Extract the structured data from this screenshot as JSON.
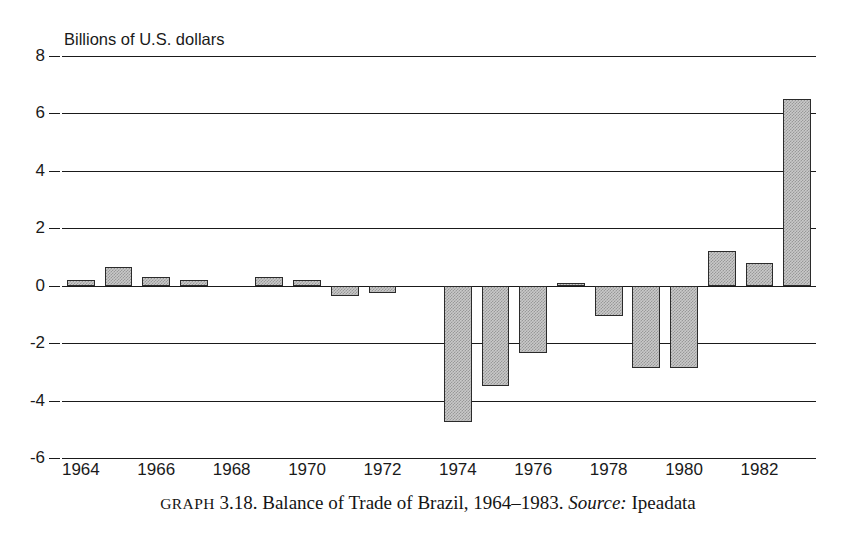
{
  "axis_title": "Billions of U.S. dollars",
  "caption": {
    "label": "GRAPH",
    "number": "3.18.",
    "text": "Balance of Trade of Brazil, 1964–1983.",
    "source_label": "Source:",
    "source_value": "Ipeadata"
  },
  "style": {
    "bar_fill": "#c9c9c9",
    "bar_border": "#2b2b2b",
    "gridline": "#1a1a1a",
    "background": "#ffffff"
  },
  "chart_data": {
    "type": "bar",
    "title": "Balance of Trade of Brazil, 1964–1983",
    "xlabel": "",
    "ylabel": "Billions of U.S. dollars",
    "ylim": [
      -6,
      8
    ],
    "yticks": [
      8,
      6,
      4,
      2,
      0,
      -2,
      -4,
      -6
    ],
    "ytick_labels": [
      "8",
      "6",
      "4",
      "2",
      "0",
      "-2",
      "-4",
      "-6"
    ],
    "xticks": [
      1964,
      1966,
      1968,
      1970,
      1972,
      1974,
      1976,
      1978,
      1980,
      1982
    ],
    "xtick_labels": [
      "1964",
      "1966",
      "1968",
      "1970",
      "1972",
      "1974",
      "1976",
      "1978",
      "1980",
      "1982"
    ],
    "xlim": [
      1963.5,
      1983.5
    ],
    "grid": "horizontal",
    "legend": "none",
    "categories": [
      1964,
      1965,
      1966,
      1967,
      1968,
      1969,
      1970,
      1971,
      1972,
      1973,
      1974,
      1975,
      1976,
      1977,
      1978,
      1979,
      1980,
      1981,
      1982,
      1983
    ],
    "values": [
      0.2,
      0.65,
      0.3,
      0.2,
      0.0,
      0.3,
      0.2,
      -0.35,
      -0.25,
      0.0,
      -4.75,
      -3.5,
      -2.35,
      0.1,
      -1.05,
      -2.85,
      -2.85,
      1.2,
      0.8,
      6.5
    ]
  }
}
